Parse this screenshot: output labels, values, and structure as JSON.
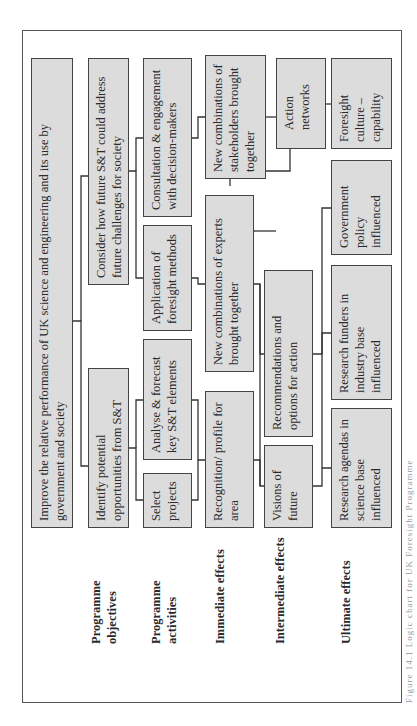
{
  "diagram": {
    "row_labels": {
      "objectives": "Programme objectives",
      "activities": "Programme activities",
      "immediate": "Immediate effects",
      "intermediate": "Intermediate effects",
      "ultimate": "Ultimate effects"
    },
    "objectives": {
      "main": "Improve the relative performance of UK science and engineering and its use by government and society",
      "identify": "Identify potential opportunities from S&T",
      "consider": "Consider how future S&T could address future challenges for society"
    },
    "activities": {
      "select": "Select projects",
      "analyse": "Analyse & forecast key S&T elements",
      "application": "Application of foresight methods",
      "consultation": "Consultation & engagement with decision-makers"
    },
    "immediate": {
      "recognition": "Recognition/ profile for area",
      "experts": "New combinations of experts brought together",
      "stakeholders": "New combinations of stakeholders brought together"
    },
    "intermediate": {
      "visions": "Visions of future",
      "recommendations": "Recommendations and options for action",
      "networks": "Action networks"
    },
    "ultimate": {
      "agendas": "Research agendas in science base influenced",
      "funders": "Research funders in industry base influenced",
      "policy": "Government policy influenced",
      "culture": "Foresight culture – capability"
    },
    "caption": "Figure 14.1 Logic chart for UK Foresight Programme"
  }
}
